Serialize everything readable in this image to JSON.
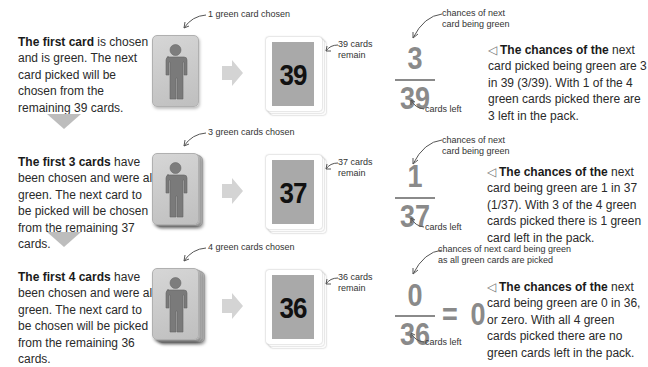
{
  "rows": [
    {
      "description": {
        "bold": "The first card",
        "rest": " is chosen and is green. The next card picked will be chosen from the remaining 39 cards."
      },
      "chosen_label": "1 green card chosen",
      "deck_number": "39",
      "remain_label": [
        "39 cards",
        "remain"
      ],
      "fraction": {
        "numerator": "3",
        "denominator": "39",
        "result": ""
      },
      "top_label": [
        "chances of next",
        "card being green"
      ],
      "bottom_label": "cards left",
      "explanation": {
        "icon": "◁",
        "bold": "The chances of the",
        "rest": " next card picked being green are 3 in 39 (3/39). With 1 of the 4 green cards picked there are 3 left in the pack."
      }
    },
    {
      "description": {
        "bold": "The first 3 cards",
        "rest": " have been chosen and were all green. The next card to be picked will be chosen from the remaining 37 cards."
      },
      "chosen_label": "3 green cards chosen",
      "deck_number": "37",
      "remain_label": [
        "37 cards",
        "remain"
      ],
      "fraction": {
        "numerator": "1",
        "denominator": "37",
        "result": ""
      },
      "top_label": [
        "chances of next",
        "card being green"
      ],
      "bottom_label": "cards left",
      "explanation": {
        "icon": "◁",
        "bold": "The chances of the",
        "rest": " next card being green are 1 in 37 (1/37). With 3 of the 4 green cards picked there is 1 green card left in the pack."
      }
    },
    {
      "description": {
        "bold": "The first 4 cards",
        "rest": " have been chosen and were all green. The next card to be chosen will be picked from the remaining 36 cards."
      },
      "chosen_label": "4 green cards chosen",
      "deck_number": "36",
      "remain_label": [
        "36 cards",
        "remain"
      ],
      "fraction": {
        "numerator": "0",
        "denominator": "36",
        "equals": "=",
        "result": "0"
      },
      "top_label": [
        "chances of next card being green",
        "as all green cards are picked"
      ],
      "bottom_label": "cards left",
      "explanation": {
        "icon": "◁",
        "bold": "The chances of the",
        "rest": " next card being green are 0 in 36, or zero. With all 4 green cards picked there are no green cards left in the pack."
      }
    }
  ],
  "icons": {
    "person": "person-icon",
    "arrow_right": "arrow-right-icon",
    "arrow_down": "arrow-down-icon",
    "pointer": "curved-pointer-arrow-icon",
    "triangle_left": "triangle-left-icon"
  },
  "colors": {
    "card_gray": "#c8c8c8",
    "deck_face": "#a9a9a9",
    "fraction_gray": "#8a8a8a",
    "arrow_gray": "#bdbdbd",
    "person_gray": "#7a7a7a"
  }
}
